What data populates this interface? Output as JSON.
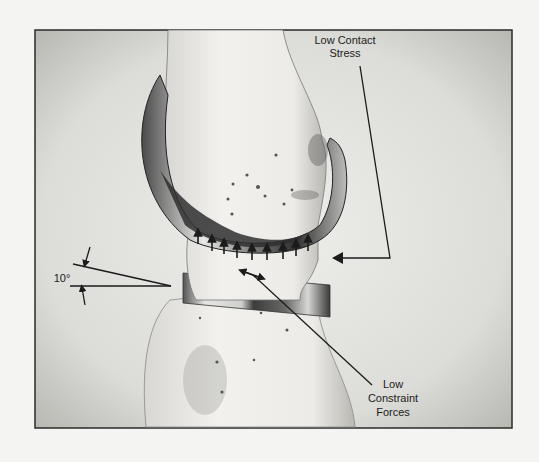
{
  "figure": {
    "labels": {
      "contact_stress": [
        "Low Contact",
        "Stress"
      ],
      "constraint_forces": [
        "Low",
        "Constraint",
        "Forces"
      ],
      "angle": "10°"
    },
    "arrow_count": 9,
    "colors": {
      "background": "#f4f4f2",
      "panel": "#dcdcd8",
      "frame": "#2a2a2a",
      "bone": "#ecebe8",
      "metal_dark": "#3a3a3a",
      "ink": "#1b1b1b"
    }
  }
}
